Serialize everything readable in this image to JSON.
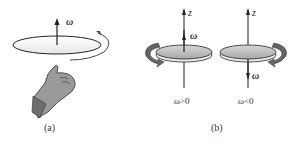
{
  "panel_a": {
    "omega_label": "ω",
    "caption": "(a)"
  },
  "panel_b": {
    "axis_label_left": "z",
    "axis_label_right": "z",
    "omega_left": "ω",
    "omega_right": "ω",
    "condition_left": "ω>0",
    "condition_right": "ω<0",
    "caption": "(b)"
  },
  "colors": {
    "line": "#222222",
    "disk_fill": "#b8b8b8",
    "arrow_fill": "#666666",
    "hand_fill": "#8a8a8a"
  }
}
